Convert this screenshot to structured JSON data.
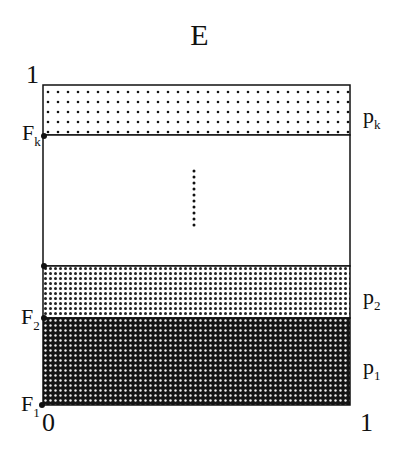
{
  "title": "E",
  "axes": {
    "y_top_label": "1",
    "x_left_label": "0",
    "x_right_label": "1"
  },
  "left_points": [
    {
      "name": "F",
      "sub": "k"
    },
    {
      "name": "F",
      "sub": "2"
    },
    {
      "name": "F",
      "sub": "1"
    }
  ],
  "bands": [
    {
      "name": "p",
      "sub": "k",
      "pattern": "sparse-dots"
    },
    {
      "name": "p",
      "sub": "2",
      "pattern": "dense-light-dots"
    },
    {
      "name": "p",
      "sub": "1",
      "pattern": "dark-with-white-dots"
    }
  ],
  "ellipsis": "vertical-dots",
  "colors": {
    "ink": "#111111",
    "background": "#ffffff"
  }
}
